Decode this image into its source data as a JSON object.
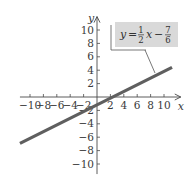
{
  "chart_data": {
    "type": "line",
    "title": "",
    "xlabel": "x",
    "ylabel": "y",
    "xlim": [
      -11.5,
      12.5
    ],
    "ylim": [
      -11.5,
      12
    ],
    "grid": false,
    "x_ticks": [
      -10,
      -8,
      -6,
      -4,
      -2,
      2,
      4,
      6,
      8,
      10
    ],
    "x_tick_labels": [
      "−10",
      "−8",
      "−6",
      "−4",
      "−2",
      "2",
      "4",
      "6",
      "8",
      "10"
    ],
    "y_ticks": [
      10,
      8,
      6,
      4,
      2,
      -2,
      -4,
      -6,
      -8,
      -10
    ],
    "y_tick_labels": [
      "10",
      "8",
      "6",
      "4",
      "2",
      "−2",
      "−4",
      "−6",
      "−8",
      "−10"
    ],
    "series": [
      {
        "name": "y = 1/2 x − 7/6",
        "equation": {
          "slope": 0.5,
          "intercept": -1.1667
        },
        "x": [
          -11.5,
          11.2
        ],
        "y": [
          -6.92,
          4.43
        ],
        "color": "#5f5f5f"
      }
    ],
    "annotations": [
      {
        "type": "equation-label",
        "lhs": "y",
        "eq_sign": "=",
        "frac1_num": "1",
        "frac1_den": "2",
        "var": "x",
        "minus": "−",
        "frac2_num": "7",
        "frac2_den": "6",
        "box_fill": "#d9d9d9",
        "points_to": [
          9.4,
          3.5
        ]
      }
    ]
  },
  "colors": {
    "axis": "#4a4a4a",
    "line": "#5f5f5f",
    "label_box": "#d9d9d9",
    "text": "#3a3a3a"
  }
}
